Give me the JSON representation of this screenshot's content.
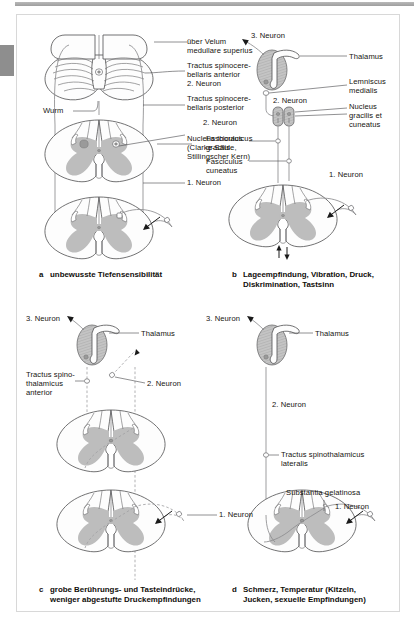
{
  "figure": {
    "language": "de",
    "panel_count": 4
  },
  "panels": [
    {
      "key": "a",
      "letter": "a",
      "caption": "unbewusste Tiefensensibilität",
      "caption_lines": [
        "unbewusste Tiefensensibilität"
      ],
      "labels": [
        {
          "name": "velum",
          "text": "über Velum\nmedullare superius"
        },
        {
          "name": "tractus-spinocerebellaris-anterior",
          "text": "Tractus spinocere-\nbellaris anterior"
        },
        {
          "name": "neuron-2-anterior",
          "text": "2. Neuron"
        },
        {
          "name": "tractus-spinocerebellaris-posterior",
          "text": "Tractus spinocere-\nbellaris posterior"
        },
        {
          "name": "neuron-2-posterior",
          "text": "2. Neuron"
        },
        {
          "name": "nucleus-thoracicus",
          "text": "Nucleus thoracicus\n(Clarke-Säule,\nStillingscher Kern)"
        },
        {
          "name": "neuron-1",
          "text": "1. Neuron"
        },
        {
          "name": "wurm",
          "text": "Wurm"
        }
      ]
    },
    {
      "key": "b",
      "letter": "b",
      "caption": "Lageempfindung, Vibration, Druck, Diskrimination, Tastsinn",
      "caption_lines": [
        "Lageempfindung, Vibration, Druck,",
        "Diskrimination, Tastsinn"
      ],
      "labels": [
        {
          "name": "neuron-3",
          "text": "3. Neuron"
        },
        {
          "name": "thalamus",
          "text": "Thalamus"
        },
        {
          "name": "lemniscus-medialis",
          "text": "Lemniscus\nmedialis"
        },
        {
          "name": "neuron-2",
          "text": "2. Neuron"
        },
        {
          "name": "nucleus-gracilis-cuneatus",
          "text": "Nucleus\ngracilis et\ncuneatus"
        },
        {
          "name": "fasciculus-gracilis",
          "text": "Fasciculus\ngracilis"
        },
        {
          "name": "fasciculus-cuneatus",
          "text": "Fasciculus\ncuneatus"
        },
        {
          "name": "neuron-1",
          "text": "1. Neuron"
        }
      ]
    },
    {
      "key": "c",
      "letter": "c",
      "caption": "grobe Berührungs- und Tasteindrücke, weniger abgestufte Druckempfindungen",
      "caption_lines": [
        "grobe Berührungs- und Tasteindrücke,",
        "weniger abgestufte Druckempfindungen"
      ],
      "labels": [
        {
          "name": "neuron-3",
          "text": "3. Neuron"
        },
        {
          "name": "thalamus",
          "text": "Thalamus"
        },
        {
          "name": "tractus-spinothalamicus-anterior",
          "text": "Tractus spino-\nthalamicus\nanterior"
        },
        {
          "name": "neuron-2",
          "text": "2. Neuron"
        },
        {
          "name": "neuron-1",
          "text": "1. Neuron"
        }
      ]
    },
    {
      "key": "d",
      "letter": "d",
      "caption": "Schmerz, Temperatur (Kitzeln, Jucken, sexuelle Empfindungen)",
      "caption_lines": [
        "Schmerz, Temperatur (Kitzeln,",
        "Jucken, sexuelle Empfindungen)"
      ],
      "labels": [
        {
          "name": "neuron-3",
          "text": "3. Neuron"
        },
        {
          "name": "thalamus",
          "text": "Thalamus"
        },
        {
          "name": "neuron-2",
          "text": "2. Neuron"
        },
        {
          "name": "tractus-spinothalamicus-lateralis",
          "text": "Tractus spinothalamicus\nlateralis"
        },
        {
          "name": "substantia-gelatinosa",
          "text": "Substantia gelatinosa"
        },
        {
          "name": "neuron-1",
          "text": "1. Neuron"
        }
      ]
    }
  ],
  "text": {
    "a_velum": "über Velum",
    "a_velum2": "medullare superius",
    "a_tsa1": "Tractus spinocere-",
    "a_tsa2": "bellaris anterior",
    "a_n2a": "2. Neuron",
    "a_tsp1": "Tractus spinocere-",
    "a_tsp2": "bellaris posterior",
    "a_n2p": "2. Neuron",
    "a_nt1": "Nucleus thoracicus",
    "a_nt2": "(Clarke-Säule,",
    "a_nt3": "Stillingscher Kern)",
    "a_n1": "1. Neuron",
    "a_wurm": "Wurm",
    "a_letter": "a",
    "a_cap": "unbewusste Tiefensensibilität",
    "b_n3": "3. Neuron",
    "b_thal": "Thalamus",
    "b_lem1": "Lemniscus",
    "b_lem2": "medialis",
    "b_n2": "2. Neuron",
    "b_ngc1": "Nucleus",
    "b_ngc2": "gracilis et",
    "b_ngc3": "cuneatus",
    "b_fg1": "Fasciculus",
    "b_fg2": "gracilis",
    "b_fc1": "Fasciculus",
    "b_fc2": "cuneatus",
    "b_n1": "1. Neuron",
    "b_letter": "b",
    "b_cap1": "Lageempfindung, Vibration, Druck,",
    "b_cap2": "Diskrimination, Tastsinn",
    "c_n3": "3. Neuron",
    "c_thal": "Thalamus",
    "c_tst1": "Tractus spino-",
    "c_tst2": "thalamicus",
    "c_tst3": "anterior",
    "c_n2": "2. Neuron",
    "c_n1": "1. Neuron",
    "c_letter": "c",
    "c_cap1": "grobe Berührungs- und Tasteindrücke,",
    "c_cap2": "weniger abgestufte Druckempfindungen",
    "d_n3": "3. Neuron",
    "d_thal": "Thalamus",
    "d_n2": "2. Neuron",
    "d_tstl1": "Tractus spinothalamicus",
    "d_tstl2": "lateralis",
    "d_sg": "Substantia gelatinosa",
    "d_n1": "1. Neuron",
    "d_letter": "d",
    "d_cap1": "Schmerz, Temperatur (Kitzeln,",
    "d_cap2": "Jucken, sexuelle Empfindungen)"
  },
  "colors": {
    "gray_matter": "#bdbdbd",
    "outline": "#58585a",
    "tract": "#8d8d8f",
    "page_background": "#ffffff",
    "top_bar": "#a8a8a8",
    "edge_tab": "#8e8e8e"
  }
}
